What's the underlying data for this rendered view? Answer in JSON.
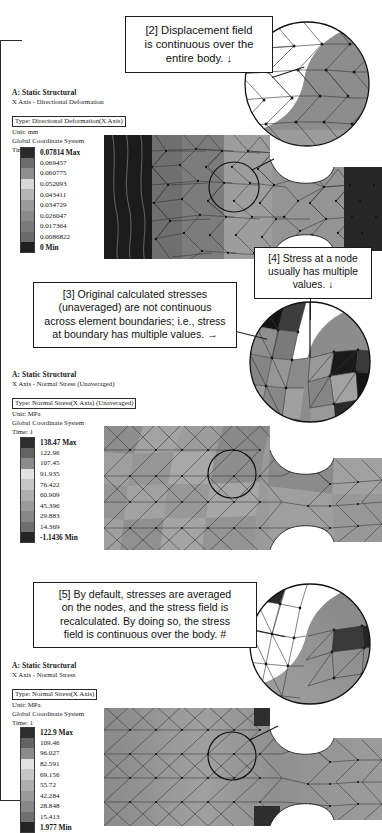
{
  "document": {
    "title": "ANSYS Static Structural results — averaged vs unaveraged stress"
  },
  "callouts": [
    {
      "id": "callout-2",
      "lines": [
        "[2] Displacement field",
        "is continuous over the",
        "entire body.  ↓"
      ]
    },
    {
      "id": "callout-3",
      "lines": [
        "[3] Original calculated stresses",
        "(unaveraged) are not continuous",
        "across element boundaries; i.e., stress",
        "at boundary has multiple values.  →"
      ]
    },
    {
      "id": "callout-4",
      "lines": [
        "[4] Stress at a node",
        "usually has multiple",
        "values.  ↓"
      ]
    },
    {
      "id": "callout-5",
      "lines": [
        "[5] By default, stresses are averaged",
        "on the nodes, and the stress field is",
        "recalculated.  By doing so, the stress",
        "field is continuous over the body.  #"
      ]
    }
  ],
  "panels": [
    {
      "id": "panel-displacement",
      "header": {
        "title": "A: Static Structural",
        "subtitle": "X Axis - Directional Deformation",
        "type_boxed": "Type: Directional Deformation(X Axis)",
        "unit": "Unit: mm",
        "coordinate_system": "Global Coordinate System",
        "time": "Time: 1"
      },
      "legend": {
        "max_label": "0.07814 Max",
        "min_label": "0 Min",
        "values": [
          "0.07814 Max",
          "0.069457",
          "0.060775",
          "0.052093",
          "0.043411",
          "0.034729",
          "0.026047",
          "0.017364",
          "0.0086822",
          "0 Min"
        ],
        "colors": [
          "#2a2a2a",
          "#6d6d6d",
          "#8f8f8f",
          "#d8d8d8",
          "#b4b4b4",
          "#9a9a9a",
          "#8a8a8a",
          "#7a7a7a",
          "#6a6a6a",
          "#1f1f1f"
        ]
      }
    },
    {
      "id": "panel-stress-unaveraged",
      "header": {
        "title": "A: Static Structural",
        "subtitle": "X Axis - Normal Stress (Unaveraged)",
        "type_boxed": "Type: Normal Stress(X Axis) (Unaveraged)",
        "unit": "Unit: MPa",
        "coordinate_system": "Global Coordinate System",
        "time": "Time: 1"
      },
      "legend": {
        "max_label": "138.47 Max",
        "min_label": "-1.1436 Min",
        "values": [
          "138.47 Max",
          "122.96",
          "107.45",
          "91.935",
          "76.422",
          "60.909",
          "45.396",
          "29.883",
          "14.369",
          "-1.1436 Min"
        ],
        "colors": [
          "#2d2d2d",
          "#636363",
          "#8b8b8b",
          "#e2e2e2",
          "#c6c6c6",
          "#aeaeae",
          "#9b9b9b",
          "#878787",
          "#6f6f6f",
          "#242424"
        ]
      }
    },
    {
      "id": "panel-stress-averaged",
      "header": {
        "title": "A: Static Structural",
        "subtitle": "X Axis - Normal Stress",
        "type_boxed": "Type: Normal Stress(X Axis)",
        "unit": "Unit: MPa",
        "coordinate_system": "Global Coordinate System",
        "time": "Time: 1"
      },
      "legend": {
        "max_label": "122.9 Max",
        "min_label": "1.977 Min",
        "values": [
          "122.9 Max",
          "109.46",
          "96.027",
          "82.591",
          "69.156",
          "55.72",
          "42.284",
          "28.848",
          "15.413",
          "1.977 Min"
        ],
        "colors": [
          "#2d2d2d",
          "#636363",
          "#8b8b8b",
          "#e2e2e2",
          "#c6c6c6",
          "#aeaeae",
          "#9b9b9b",
          "#878787",
          "#6f6f6f",
          "#242424"
        ]
      }
    }
  ]
}
